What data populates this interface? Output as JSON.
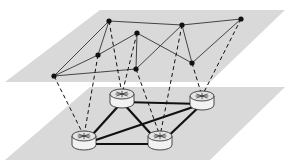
{
  "diagram": {
    "colors": {
      "plane": "#d9d9d9",
      "node": "#111111",
      "virtual_link": "#333333",
      "physical_link": "#111111",
      "mapping_link": "#111111",
      "router_fill": "#f2f2f2"
    },
    "top_plane": {
      "label": "virtual-layer",
      "polygon": [
        [
          100,
          10
        ],
        [
          285,
          10
        ],
        [
          210,
          82
        ],
        [
          5,
          82
        ]
      ],
      "nodes": [
        {
          "id": "v1",
          "x": 109,
          "y": 21
        },
        {
          "id": "v2",
          "x": 182,
          "y": 25
        },
        {
          "id": "v3",
          "x": 241,
          "y": 19
        },
        {
          "id": "v4",
          "x": 137,
          "y": 33
        },
        {
          "id": "v5",
          "x": 98,
          "y": 55
        },
        {
          "id": "v6",
          "x": 192,
          "y": 63
        },
        {
          "id": "v7",
          "x": 136,
          "y": 69
        },
        {
          "id": "v8",
          "x": 54,
          "y": 76
        }
      ],
      "edges": [
        [
          "v1",
          "v2"
        ],
        [
          "v2",
          "v3"
        ],
        [
          "v1",
          "v8"
        ],
        [
          "v1",
          "v5"
        ],
        [
          "v8",
          "v5"
        ],
        [
          "v5",
          "v4"
        ],
        [
          "v4",
          "v7"
        ],
        [
          "v8",
          "v7"
        ],
        [
          "v4",
          "v6"
        ],
        [
          "v2",
          "v7"
        ],
        [
          "v2",
          "v6"
        ],
        [
          "v3",
          "v6"
        ]
      ]
    },
    "bottom_plane": {
      "label": "physical-layer",
      "polygon": [
        [
          90,
          87
        ],
        [
          285,
          87
        ],
        [
          210,
          160
        ],
        [
          5,
          160
        ]
      ],
      "routers": [
        {
          "id": "r1",
          "x": 122,
          "y": 98
        },
        {
          "id": "r2",
          "x": 202,
          "y": 100
        },
        {
          "id": "r3",
          "x": 84,
          "y": 140
        },
        {
          "id": "r4",
          "x": 160,
          "y": 140
        }
      ],
      "links": [
        [
          "r1",
          "r2"
        ],
        [
          "r1",
          "r3"
        ],
        [
          "r1",
          "r4"
        ],
        [
          "r3",
          "r4"
        ],
        [
          "r3",
          "r2"
        ],
        [
          "r4",
          "r2"
        ]
      ]
    },
    "mappings": [
      [
        "v8",
        "r3"
      ],
      [
        "v5",
        "r3"
      ],
      [
        "v1",
        "r1"
      ],
      [
        "v4",
        "r1"
      ],
      [
        "v7",
        "r4"
      ],
      [
        "v2",
        "r4"
      ],
      [
        "v6",
        "r2"
      ],
      [
        "v3",
        "r2"
      ]
    ]
  }
}
